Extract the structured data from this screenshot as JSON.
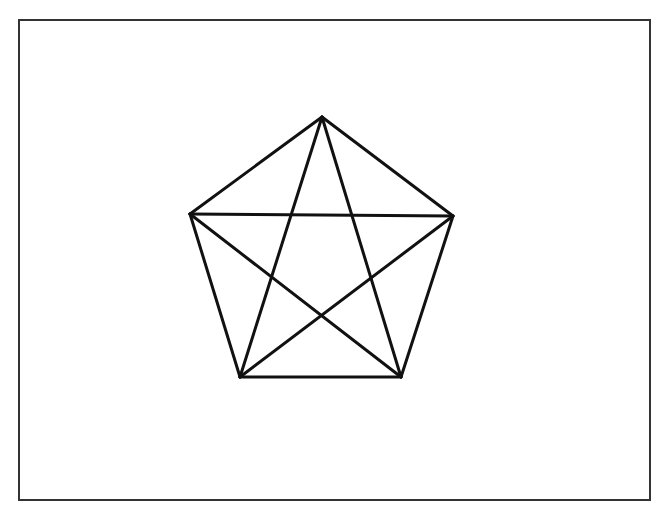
{
  "diagram": {
    "type": "complete-graph-K5",
    "frame": {
      "x": 18,
      "y": 19,
      "width": 631,
      "height": 480,
      "stroke": "#333333",
      "stroke_width": 2
    },
    "line_color": "#111111",
    "line_width": 3,
    "vertices": [
      {
        "id": "top",
        "x": 322,
        "y": 117
      },
      {
        "id": "right",
        "x": 453,
        "y": 216
      },
      {
        "id": "bottom-right",
        "x": 401,
        "y": 377
      },
      {
        "id": "bottom-left",
        "x": 240,
        "y": 377
      },
      {
        "id": "left",
        "x": 190,
        "y": 214
      }
    ],
    "edges": [
      {
        "from": 0,
        "to": 1,
        "kind": "side"
      },
      {
        "from": 1,
        "to": 2,
        "kind": "side"
      },
      {
        "from": 2,
        "to": 3,
        "kind": "side"
      },
      {
        "from": 3,
        "to": 4,
        "kind": "side"
      },
      {
        "from": 4,
        "to": 0,
        "kind": "side"
      },
      {
        "from": 0,
        "to": 2,
        "kind": "diagonal"
      },
      {
        "from": 0,
        "to": 3,
        "kind": "diagonal"
      },
      {
        "from": 1,
        "to": 3,
        "kind": "diagonal"
      },
      {
        "from": 1,
        "to": 4,
        "kind": "diagonal"
      },
      {
        "from": 2,
        "to": 4,
        "kind": "diagonal"
      }
    ]
  }
}
